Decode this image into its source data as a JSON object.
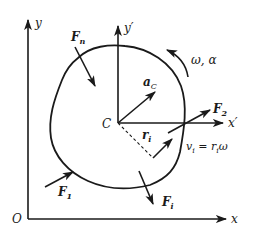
{
  "diagram": {
    "colors": {
      "ink": "#1a1a1a",
      "background": "#ffffff"
    },
    "fixed_frame": {
      "origin_label": "O",
      "x_label": "x",
      "y_label": "y"
    },
    "body_frame": {
      "origin_label": "C",
      "x_label": "x",
      "x_prime": "′",
      "y_label": "y",
      "y_prime": "′"
    },
    "forces": [
      {
        "name": "F_n",
        "base": "F",
        "sub": "n"
      },
      {
        "name": "F_2",
        "base": "F",
        "sub": "2"
      },
      {
        "name": "F_1",
        "base": "F",
        "sub": "1"
      },
      {
        "name": "F_i",
        "base": "F",
        "sub": "i"
      }
    ],
    "acceleration": {
      "base": "a",
      "sub": "C"
    },
    "rotation": {
      "label": "ω, α"
    },
    "radius": {
      "base": "r",
      "sub": "i"
    },
    "velocity_equation": {
      "lhs_base": "v",
      "lhs_sub": "i",
      "equals": " = ",
      "rhs_base": "r",
      "rhs_sub": "i",
      "rhs_tail": "ω"
    }
  }
}
